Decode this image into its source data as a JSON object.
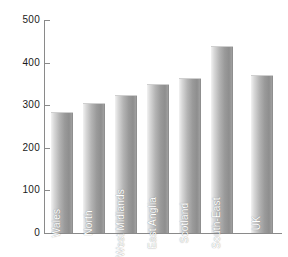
{
  "chart_data": {
    "type": "bar",
    "title": "",
    "subtitle": "",
    "xlabel": "",
    "ylabel": "",
    "ylim": [
      0,
      500
    ],
    "yticks": [
      0,
      100,
      200,
      300,
      400,
      500
    ],
    "ytick_labels": [
      "0",
      "100",
      "200",
      "300",
      "400",
      "500"
    ],
    "grid": false,
    "legend": null,
    "categories": [
      "Wales",
      "North",
      "West Midlands",
      "East Anglia",
      "Scotland",
      "South-East",
      "UK"
    ],
    "values": [
      282,
      303,
      322,
      347,
      361,
      437,
      369
    ],
    "bars": [
      {
        "label": "Wales",
        "value": 282
      },
      {
        "label": "North",
        "value": 303
      },
      {
        "label": "West Midlands",
        "value": 322
      },
      {
        "label": "East Anglia",
        "value": 347
      },
      {
        "label": "Scotland",
        "value": 361
      },
      {
        "label": "South-East",
        "value": 437
      },
      {
        "label": "UK",
        "value": 369
      }
    ]
  },
  "colors": {
    "background": "#ffffff",
    "axis": "#8a8a8a",
    "tick_text": "#1a1a1a",
    "bar_light": "#f2f2f2",
    "bar_dark": "#8e8e8e",
    "bar_label_text": "#ffffff"
  }
}
